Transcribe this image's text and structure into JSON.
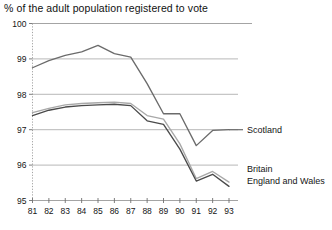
{
  "chart_data": {
    "type": "line",
    "title": "% of the adult population registered to vote",
    "xlabel": "",
    "ylabel": "",
    "xlim": [
      81,
      93
    ],
    "ylim": [
      95,
      100
    ],
    "grid": true,
    "legend_position": "right-inline",
    "x": [
      81,
      82,
      83,
      84,
      85,
      86,
      87,
      88,
      89,
      90,
      91,
      92,
      93
    ],
    "xtick_labels": [
      "81",
      "82",
      "83",
      "84",
      "85",
      "86",
      "87",
      "88",
      "89",
      "90",
      "91",
      "92",
      "93"
    ],
    "ytick_labels": [
      "95",
      "96",
      "97",
      "98",
      "99",
      "100"
    ],
    "ytick_values": [
      95,
      96,
      97,
      98,
      99,
      100
    ],
    "series": [
      {
        "name": "Scotland",
        "color": "#6b6b6b",
        "values": [
          98.75,
          98.95,
          99.1,
          99.2,
          99.38,
          99.15,
          99.05,
          98.3,
          97.45,
          97.45,
          96.55,
          96.98,
          97.0
        ]
      },
      {
        "name": "Britain",
        "color": "#a8a8a8",
        "values": [
          97.48,
          97.6,
          97.7,
          97.74,
          97.76,
          97.78,
          97.74,
          97.4,
          97.3,
          96.6,
          95.62,
          95.82,
          95.52
        ]
      },
      {
        "name": "England and Wales",
        "color": "#4a4a4a",
        "values": [
          97.4,
          97.55,
          97.64,
          97.68,
          97.7,
          97.72,
          97.68,
          97.25,
          97.15,
          96.45,
          95.55,
          95.74,
          95.4
        ]
      }
    ]
  },
  "labels": {
    "scotland": "Scotland",
    "britain": "Britain",
    "england_and_wales": "England and Wales"
  }
}
